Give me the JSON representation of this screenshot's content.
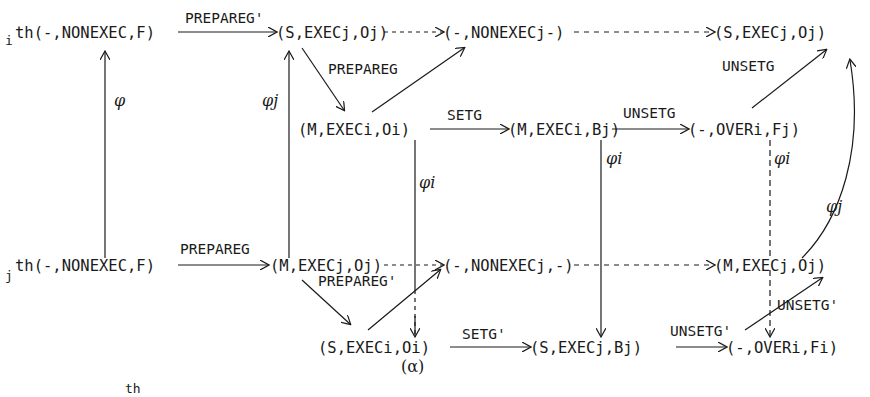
{
  "nodes": {
    "top_start_prefix": "i",
    "top_start": "th(-,NONEXEC,F)",
    "top_s_execj": "(S,EXECj,Oj)",
    "top_nonexecj": "(-,NONEXECj-)",
    "top_right": "(S,EXECj,Oj)",
    "mid_m_execi": "(M,EXECi,Oi)",
    "mid_m_execi_bj": "(M,EXECi,Bj)",
    "mid_over": "(-,OVERi,Fj)",
    "bot_start_prefix": "j",
    "bot_start": "th(-,NONEXEC,F)",
    "bot_m_execj": "(M,EXECj,Oj)",
    "bot_nonexecj": "(-,NONEXECj,-)",
    "bot_right": "(M,EXECj,Oj)",
    "low_s_execi": "(S,EXECi,Oi)",
    "low_s_execj_bi": "(S,EXECj,Bj)",
    "low_over": "(-,OVERi,Fi)",
    "alpha_label": "(α)"
  },
  "edges": {
    "prepareg_prime_top": "PREPAREG'",
    "prepareg_top": "PREPAREG",
    "setg": "SETG",
    "unsetg_mid": "UNSETG",
    "unsetg_top": "UNSETG",
    "prepareg_bot": "PREPAREG",
    "prepareg_prime_bot": "PREPAREG'",
    "setg_prime": "SETG'",
    "unsetg_prime_low": "UNSETG'",
    "unsetg_prime_right": "UNSETG'"
  },
  "maps": {
    "phi": "φ",
    "phi_j_left": "φj",
    "phi_i_mid": "φi",
    "phi_i_right1": "φi",
    "phi_i_right2": "φi",
    "phi_j_curve": "φj"
  },
  "footer_fragment": "th"
}
